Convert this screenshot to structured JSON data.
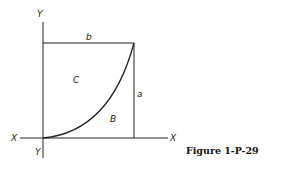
{
  "figure": {
    "caption": "Figure 1-P-29",
    "labels": {
      "y_top": "Y",
      "y_bottom": "Y",
      "x_left": "X",
      "x_right": "X",
      "width": "b",
      "height": "a",
      "region_upper": "C",
      "region_lower": "B"
    }
  },
  "colors": {
    "line": "#222222",
    "background": "#ffffff"
  }
}
